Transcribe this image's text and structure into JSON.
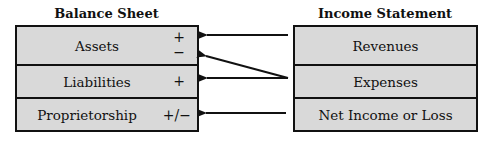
{
  "balance_sheet": {
    "title": "Balance Sheet",
    "rows": [
      {
        "label": "Assets",
        "sign_top": "+",
        "sign_bottom": "−"
      },
      {
        "label": "Liabilities",
        "sign": "+"
      },
      {
        "label": "Proprietorship",
        "sign": "+/−"
      }
    ]
  },
  "income_statement": {
    "title": "Income Statement",
    "rows": [
      {
        "label": "Revenues"
      },
      {
        "label": "Expenses"
      },
      {
        "label": "Net Income or Loss"
      }
    ]
  },
  "arrows": [
    {
      "from": "Revenues",
      "to": "Assets (+)"
    },
    {
      "from": "Expenses",
      "to": "Assets (−)"
    },
    {
      "from": "Expenses",
      "to": "Liabilities (+)"
    },
    {
      "from": "Net Income or Loss",
      "to": "Proprietorship (+/−)"
    }
  ],
  "colors": {
    "box_fill": "#d9d9d9",
    "line": "#111111"
  }
}
